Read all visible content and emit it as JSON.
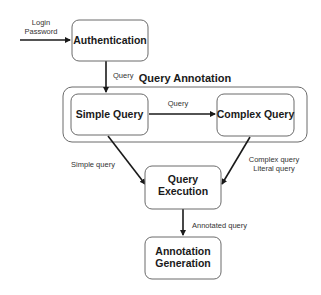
{
  "diagram": {
    "group": {
      "title": "Query Annotation"
    },
    "nodes": {
      "authentication": "Authentication",
      "simple_query": "Simple Query",
      "complex_query": "Complex Query",
      "query_execution_line1": "Query",
      "query_execution_line2": "Execution",
      "annotation_generation_line1": "Annotation",
      "annotation_generation_line2": "Generation"
    },
    "edge_labels": {
      "input_line1": "Login",
      "input_line2": "Password",
      "auth_to_simple": "Query",
      "simple_to_complex": "Query",
      "simple_to_execution": "Simple query",
      "complex_to_execution_line1": "Complex query",
      "complex_to_execution_line2": "Literal query",
      "execution_to_generation": "Annotated query"
    }
  }
}
